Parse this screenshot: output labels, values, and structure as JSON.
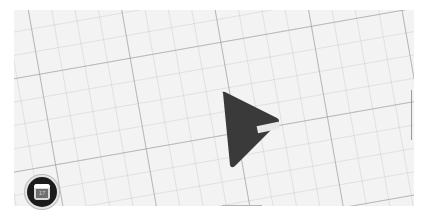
{
  "map": {
    "grid_rotation_deg": -10,
    "background_color": "#f3f3f3",
    "grid_major_color": "#969696",
    "grid_minor_color": "#bebebe"
  },
  "marker": {
    "type": "navigation-arrow",
    "fill_color": "#3a3a3a",
    "highlight_color": "#e8e8e8"
  },
  "floating_button": {
    "icon": "calendar-icon",
    "glyph": "17",
    "background_color": "#1c1c1c"
  }
}
